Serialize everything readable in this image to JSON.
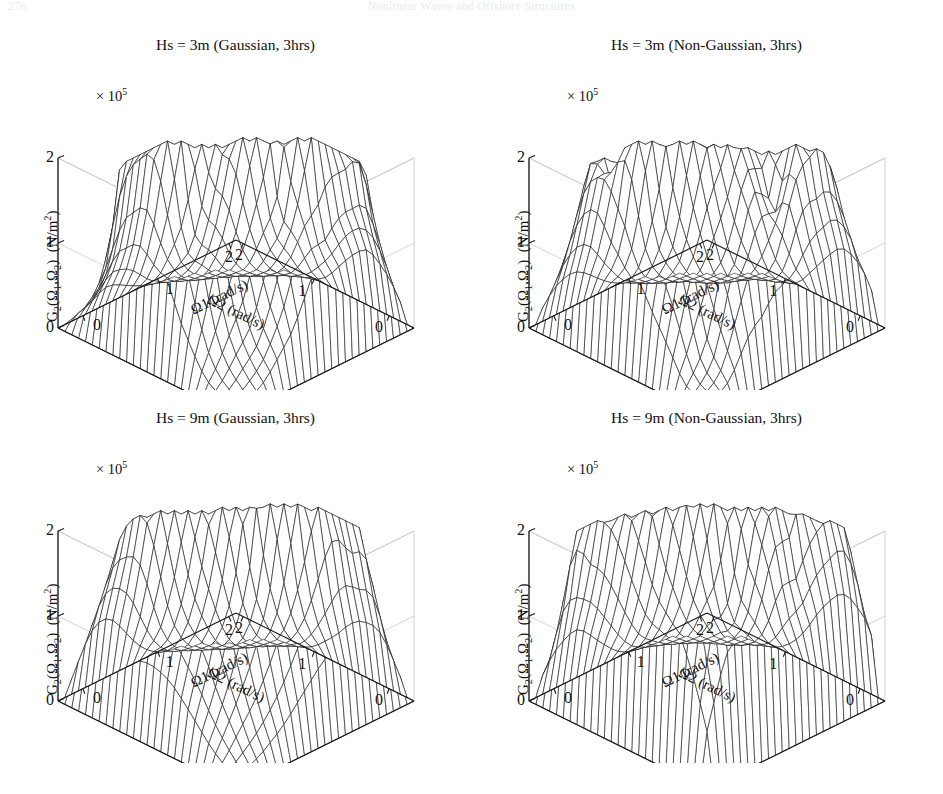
{
  "page_header": {
    "page_number": "276",
    "running_title": "Nonlinear Waves and Offshore Structures"
  },
  "axes": {
    "y_label": "G2(Ω1,Ω2)  (N/m2)",
    "y_exponent": "× 10",
    "y_exponent_power": "5",
    "y_ticks": [
      "2",
      "1",
      "0"
    ],
    "left_axis_label": "Ω2 (rad/s)",
    "right_axis_label": "Ω1 (rad/s)",
    "left_ticks": [
      "0",
      "1",
      "2"
    ],
    "right_ticks": [
      "2",
      "1",
      "0"
    ]
  },
  "panels": [
    {
      "id": "p1",
      "title": "Hs = 3m (Gaussian, 3hrs)",
      "seed": 17,
      "peak": 2.05,
      "rough": 0.62,
      "spread": 0.3,
      "gap": 0.26
    },
    {
      "id": "p2",
      "title": "Hs = 3m (Non-Gaussian, 3hrs)",
      "seed": 43,
      "peak": 1.48,
      "rough": 0.8,
      "spread": 0.34,
      "gap": 0.22
    },
    {
      "id": "p3",
      "title": "Hs = 9m (Gaussian, 3hrs)",
      "seed": 71,
      "peak": 2.1,
      "rough": 0.34,
      "spread": 0.3,
      "gap": 0.24
    },
    {
      "id": "p4",
      "title": "Hs = 9m (Non-Gaussian, 3hrs)",
      "seed": 95,
      "peak": 1.72,
      "rough": 0.7,
      "spread": 0.44,
      "gap": 0.14
    }
  ],
  "chart_data": {
    "type": "surface",
    "count": 4,
    "xlabel": "Ω1 (rad/s)",
    "ylabel": "Ω2 (rad/s)",
    "zlabel": "G2(Ω1,Ω2)  (N/m2)",
    "x": [
      0,
      1,
      2
    ],
    "y": [
      0,
      1,
      2
    ],
    "xlim": [
      0,
      2.4
    ],
    "ylim": [
      0,
      2.4
    ],
    "zlim": [
      0,
      2.0
    ],
    "z_scale_factor": 100000,
    "z_units": "N/m^2",
    "grid": true,
    "legend": "none",
    "projection": "3d-wireframe-mesh",
    "series": [
      {
        "name": "Hs = 3m (Gaussian, 3hrs)",
        "Hs_m": 3,
        "process": "Gaussian",
        "duration": "3hrs",
        "z_peak": 2.05,
        "peak_clusters": 2,
        "notes": "two sharp peak groups near omega1 and omega2 axes; flat zero valley along diagonal"
      },
      {
        "name": "Hs = 3m (Non-Gaussian, 3hrs)",
        "Hs_m": 3,
        "process": "Non-Gaussian",
        "duration": "3hrs",
        "z_peak": 1.48,
        "peak_clusters": 2,
        "notes": "lower, more jagged multi-modal ridges"
      },
      {
        "name": "Hs = 9m (Gaussian, 3hrs)",
        "Hs_m": 9,
        "process": "Gaussian",
        "duration": "3hrs",
        "z_peak": 2.1,
        "peak_clusters": 2,
        "notes": "tall smooth plateau-like peaks reaching the 2x10^5 ceiling"
      },
      {
        "name": "Hs = 9m (Non-Gaussian, 3hrs)",
        "Hs_m": 9,
        "process": "Non-Gaussian",
        "duration": "3hrs",
        "z_peak": 1.72,
        "peak_clusters": 2,
        "notes": "broad spread-out peaks merging toward the centre"
      }
    ]
  }
}
